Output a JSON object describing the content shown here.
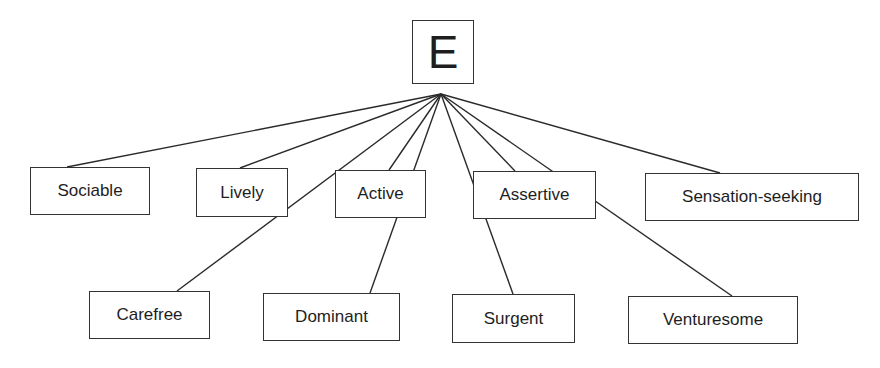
{
  "diagram": {
    "root": {
      "label": "E",
      "x": 412,
      "y": 20,
      "w": 62,
      "h": 64
    },
    "apex": {
      "x": 441,
      "y": 94
    },
    "nodes": [
      {
        "id": "sociable",
        "label": "Sociable",
        "x": 30,
        "y": 167,
        "w": 120,
        "h": 48,
        "anchor": [
          67,
          167
        ]
      },
      {
        "id": "lively",
        "label": "Lively",
        "x": 196,
        "y": 168,
        "w": 92,
        "h": 49,
        "anchor": [
          240,
          168
        ]
      },
      {
        "id": "active",
        "label": "Active",
        "x": 335,
        "y": 170,
        "w": 91,
        "h": 48,
        "anchor": [
          389,
          170
        ]
      },
      {
        "id": "assertive",
        "label": "Assertive",
        "x": 473,
        "y": 171,
        "w": 123,
        "h": 48,
        "anchor": [
          515,
          171
        ]
      },
      {
        "id": "sensation-seeking",
        "label": "Sensation-seeking",
        "x": 645,
        "y": 173,
        "w": 214,
        "h": 48,
        "anchor": [
          720,
          173
        ]
      },
      {
        "id": "carefree",
        "label": "Carefree",
        "x": 89,
        "y": 291,
        "w": 121,
        "h": 48,
        "anchor": [
          177,
          291
        ]
      },
      {
        "id": "dominant",
        "label": "Dominant",
        "x": 263,
        "y": 293,
        "w": 137,
        "h": 48,
        "anchor": [
          370,
          293
        ]
      },
      {
        "id": "surgent",
        "label": "Surgent",
        "x": 452,
        "y": 294,
        "w": 123,
        "h": 49,
        "anchor": [
          513,
          294
        ]
      },
      {
        "id": "venturesome",
        "label": "Venturesome",
        "x": 628,
        "y": 296,
        "w": 170,
        "h": 48,
        "anchor": [
          732,
          296
        ]
      }
    ]
  }
}
